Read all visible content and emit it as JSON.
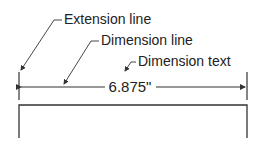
{
  "diagram": {
    "labels": {
      "extension_line": "Extension line",
      "dimension_line": "Dimension line",
      "dimension_text": "Dimension text"
    },
    "dimension_value": "6.875\"",
    "colors": {
      "line": "#333333",
      "text": "#222222",
      "background": "#ffffff"
    }
  }
}
